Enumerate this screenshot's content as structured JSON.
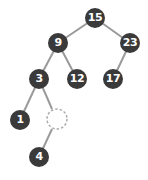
{
  "diagram": {
    "type": "binary-tree",
    "colors": {
      "node": "#3a3a3a",
      "edge": "#9a9a9a",
      "label": "#ffffff",
      "empty_node_stroke": "#aaaaaa"
    },
    "nodes": [
      {
        "id": "n15",
        "label": "15",
        "x": 95,
        "y": 18
      },
      {
        "id": "n9",
        "label": "9",
        "x": 58,
        "y": 43
      },
      {
        "id": "n23",
        "label": "23",
        "x": 130,
        "y": 43
      },
      {
        "id": "n3",
        "label": "3",
        "x": 39,
        "y": 79
      },
      {
        "id": "n12",
        "label": "12",
        "x": 77,
        "y": 79
      },
      {
        "id": "n17",
        "label": "17",
        "x": 113,
        "y": 79
      },
      {
        "id": "n1",
        "label": "1",
        "x": 20,
        "y": 120
      },
      {
        "id": "nEmpty",
        "label": "",
        "x": 57,
        "y": 119,
        "empty": true
      },
      {
        "id": "n4",
        "label": "4",
        "x": 39,
        "y": 157
      }
    ],
    "edges": [
      {
        "from": "n15",
        "to": "n9"
      },
      {
        "from": "n15",
        "to": "n23"
      },
      {
        "from": "n9",
        "to": "n3"
      },
      {
        "from": "n9",
        "to": "n12"
      },
      {
        "from": "n23",
        "to": "n17"
      },
      {
        "from": "n3",
        "to": "n1"
      },
      {
        "from": "n3",
        "to": "nEmpty"
      },
      {
        "from": "nEmpty",
        "to": "n4"
      }
    ]
  }
}
